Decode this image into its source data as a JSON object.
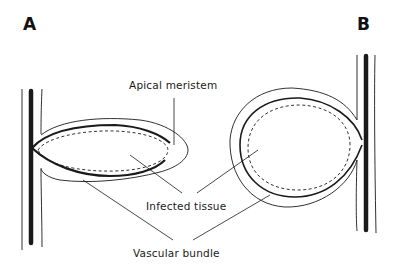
{
  "figure": {
    "panels": [
      {
        "id": "A",
        "label": "A"
      },
      {
        "id": "B",
        "label": "B"
      }
    ],
    "labels": {
      "apical_meristem": "Apical meristem",
      "infected_tissue": "Infected tissue",
      "vascular_bundle": "Vascular bundle"
    },
    "colors": {
      "line": "#1a1a1a",
      "background": "#ffffff"
    }
  }
}
